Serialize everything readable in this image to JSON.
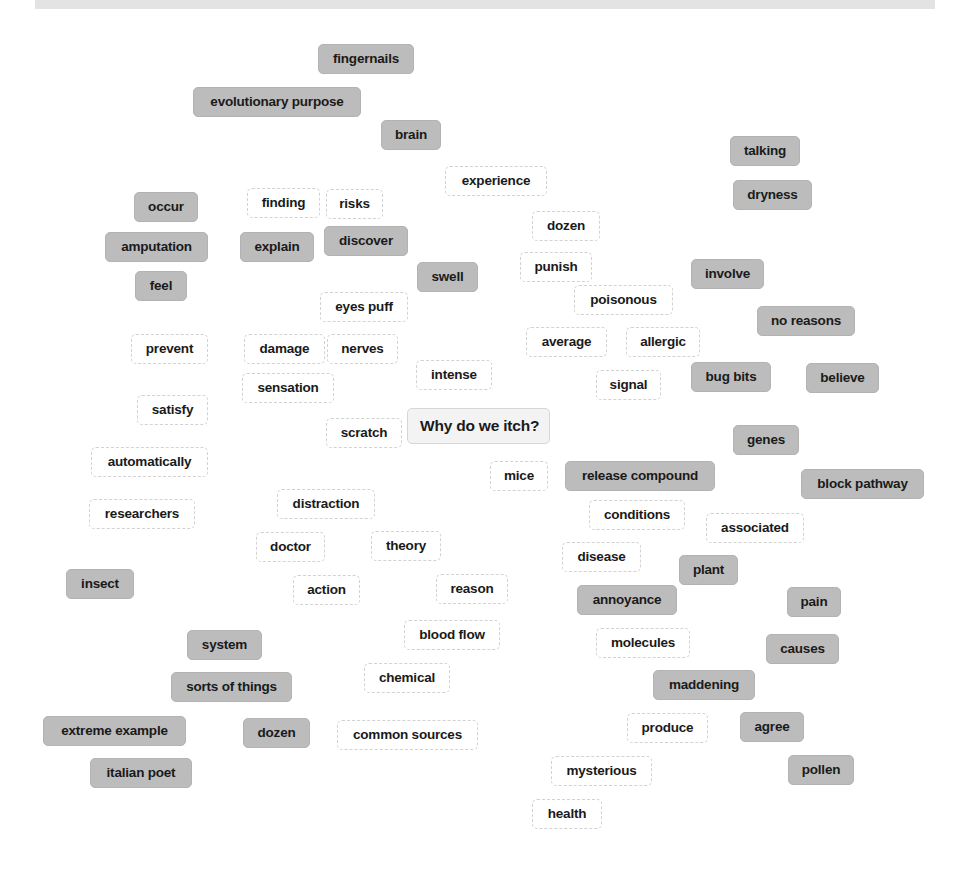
{
  "header": {
    "title": ""
  },
  "diagram": {
    "center": {
      "label": "Why do we itch?",
      "x": 407,
      "y": 408,
      "w": 143
    },
    "nodes": [
      {
        "label": "fingernails",
        "style": "gray",
        "x": 318,
        "y": 44,
        "w": 96
      },
      {
        "label": "evolutionary purpose",
        "style": "gray",
        "x": 193,
        "y": 87,
        "w": 168
      },
      {
        "label": "brain",
        "style": "gray",
        "x": 381,
        "y": 120,
        "w": 60
      },
      {
        "label": "talking",
        "style": "gray",
        "x": 730,
        "y": 136,
        "w": 70
      },
      {
        "label": "experience",
        "style": "white",
        "x": 445,
        "y": 166,
        "w": 102
      },
      {
        "label": "dryness",
        "style": "gray",
        "x": 733,
        "y": 180,
        "w": 79
      },
      {
        "label": "occur",
        "style": "gray",
        "x": 134,
        "y": 192,
        "w": 64
      },
      {
        "label": "finding",
        "style": "white",
        "x": 247,
        "y": 188,
        "w": 73
      },
      {
        "label": "risks",
        "style": "white",
        "x": 326,
        "y": 189,
        "w": 57
      },
      {
        "label": "dozen",
        "style": "white",
        "x": 532,
        "y": 211,
        "w": 68
      },
      {
        "label": "amputation",
        "style": "gray",
        "x": 105,
        "y": 232,
        "w": 103
      },
      {
        "label": "explain",
        "style": "gray",
        "x": 240,
        "y": 232,
        "w": 74
      },
      {
        "label": "discover",
        "style": "gray",
        "x": 324,
        "y": 226,
        "w": 84
      },
      {
        "label": "punish",
        "style": "white",
        "x": 520,
        "y": 252,
        "w": 72
      },
      {
        "label": "swell",
        "style": "gray",
        "x": 417,
        "y": 262,
        "w": 61
      },
      {
        "label": "involve",
        "style": "gray",
        "x": 691,
        "y": 259,
        "w": 73
      },
      {
        "label": "feel",
        "style": "gray",
        "x": 135,
        "y": 271,
        "w": 52
      },
      {
        "label": "poisonous",
        "style": "white",
        "x": 574,
        "y": 285,
        "w": 99
      },
      {
        "label": "eyes puff",
        "style": "white",
        "x": 320,
        "y": 292,
        "w": 88
      },
      {
        "label": "no reasons",
        "style": "gray",
        "x": 757,
        "y": 306,
        "w": 98
      },
      {
        "label": "prevent",
        "style": "white",
        "x": 131,
        "y": 334,
        "w": 77
      },
      {
        "label": "damage",
        "style": "white",
        "x": 244,
        "y": 334,
        "w": 81
      },
      {
        "label": "nerves",
        "style": "white",
        "x": 327,
        "y": 334,
        "w": 71
      },
      {
        "label": "average",
        "style": "white",
        "x": 526,
        "y": 327,
        "w": 81
      },
      {
        "label": "allergic",
        "style": "white",
        "x": 626,
        "y": 327,
        "w": 74
      },
      {
        "label": "intense",
        "style": "white",
        "x": 416,
        "y": 360,
        "w": 76
      },
      {
        "label": "sensation",
        "style": "white",
        "x": 242,
        "y": 373,
        "w": 92
      },
      {
        "label": "signal",
        "style": "white",
        "x": 596,
        "y": 370,
        "w": 65
      },
      {
        "label": "bug bits",
        "style": "gray",
        "x": 691,
        "y": 362,
        "w": 80
      },
      {
        "label": "believe",
        "style": "gray",
        "x": 806,
        "y": 363,
        "w": 73
      },
      {
        "label": "satisfy",
        "style": "white",
        "x": 137,
        "y": 395,
        "w": 71
      },
      {
        "label": "scratch",
        "style": "white",
        "x": 326,
        "y": 418,
        "w": 76
      },
      {
        "label": "genes",
        "style": "gray",
        "x": 733,
        "y": 425,
        "w": 66
      },
      {
        "label": "automatically",
        "style": "white",
        "x": 91,
        "y": 447,
        "w": 117
      },
      {
        "label": "mice",
        "style": "white",
        "x": 490,
        "y": 461,
        "w": 58
      },
      {
        "label": "release compound",
        "style": "gray",
        "x": 565,
        "y": 461,
        "w": 150
      },
      {
        "label": "block pathway",
        "style": "gray",
        "x": 801,
        "y": 469,
        "w": 123
      },
      {
        "label": "distraction",
        "style": "white",
        "x": 277,
        "y": 489,
        "w": 98
      },
      {
        "label": "researchers",
        "style": "white",
        "x": 89,
        "y": 499,
        "w": 106
      },
      {
        "label": "conditions",
        "style": "white",
        "x": 589,
        "y": 500,
        "w": 96
      },
      {
        "label": "associated",
        "style": "white",
        "x": 706,
        "y": 513,
        "w": 98
      },
      {
        "label": "doctor",
        "style": "white",
        "x": 256,
        "y": 532,
        "w": 69
      },
      {
        "label": "theory",
        "style": "white",
        "x": 371,
        "y": 531,
        "w": 70
      },
      {
        "label": "disease",
        "style": "white",
        "x": 562,
        "y": 542,
        "w": 79
      },
      {
        "label": "plant",
        "style": "gray",
        "x": 679,
        "y": 555,
        "w": 59
      },
      {
        "label": "insect",
        "style": "gray",
        "x": 66,
        "y": 569,
        "w": 68
      },
      {
        "label": "action",
        "style": "white",
        "x": 293,
        "y": 575,
        "w": 67
      },
      {
        "label": "reason",
        "style": "white",
        "x": 436,
        "y": 574,
        "w": 72
      },
      {
        "label": "annoyance",
        "style": "gray",
        "x": 577,
        "y": 585,
        "w": 100
      },
      {
        "label": "pain",
        "style": "gray",
        "x": 787,
        "y": 587,
        "w": 54
      },
      {
        "label": "blood flow",
        "style": "white",
        "x": 404,
        "y": 620,
        "w": 96
      },
      {
        "label": "system",
        "style": "gray",
        "x": 187,
        "y": 630,
        "w": 75
      },
      {
        "label": "molecules",
        "style": "white",
        "x": 596,
        "y": 628,
        "w": 94
      },
      {
        "label": "causes",
        "style": "gray",
        "x": 766,
        "y": 634,
        "w": 73
      },
      {
        "label": "sorts of things",
        "style": "gray",
        "x": 171,
        "y": 672,
        "w": 121
      },
      {
        "label": "chemical",
        "style": "white",
        "x": 364,
        "y": 663,
        "w": 86
      },
      {
        "label": "maddening",
        "style": "gray",
        "x": 653,
        "y": 670,
        "w": 102
      },
      {
        "label": "extreme example",
        "style": "gray",
        "x": 43,
        "y": 716,
        "w": 143
      },
      {
        "label": "dozen",
        "style": "gray",
        "x": 243,
        "y": 718,
        "w": 67
      },
      {
        "label": "common sources",
        "style": "white",
        "x": 337,
        "y": 720,
        "w": 141
      },
      {
        "label": "produce",
        "style": "white",
        "x": 627,
        "y": 713,
        "w": 81
      },
      {
        "label": "agree",
        "style": "gray",
        "x": 740,
        "y": 712,
        "w": 64
      },
      {
        "label": "italian poet",
        "style": "gray",
        "x": 90,
        "y": 758,
        "w": 102
      },
      {
        "label": "mysterious",
        "style": "white",
        "x": 551,
        "y": 756,
        "w": 101
      },
      {
        "label": "pollen",
        "style": "gray",
        "x": 788,
        "y": 755,
        "w": 66
      },
      {
        "label": "health",
        "style": "white",
        "x": 532,
        "y": 799,
        "w": 70
      }
    ]
  }
}
